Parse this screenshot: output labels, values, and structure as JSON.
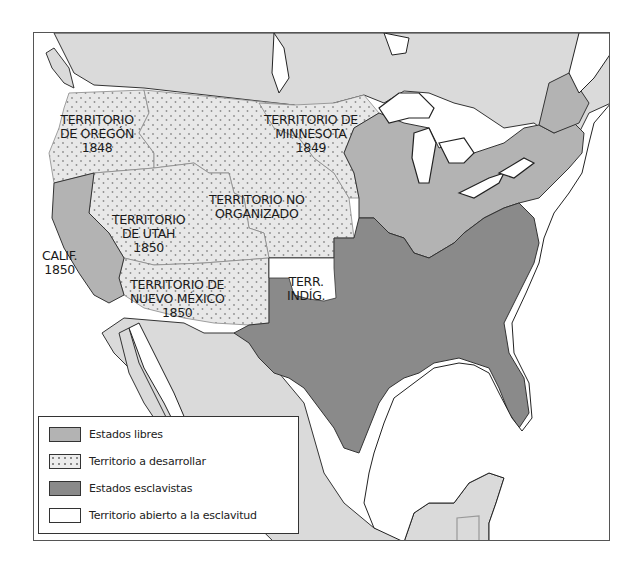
{
  "map": {
    "colors": {
      "foreign_land": "#dadada",
      "free_states": "#b3b3b3",
      "slave_states": "#8a8a8a",
      "territory_dotted": "#e8e8e8",
      "dot": "#9a9a9a",
      "open_to_slavery": "#ffffff",
      "water": "#ffffff",
      "border": "#333333"
    },
    "labels": {
      "oregon": {
        "line1": "TERRITORIO",
        "line2": "DE OREGÓN",
        "year": "1848"
      },
      "minnesota": {
        "line1": "TERRITORIO DE",
        "line2": "MINNESOTA",
        "year": "1849"
      },
      "unorganized": {
        "line1": "TERRITORIO NO",
        "line2": "ORGANIZADO"
      },
      "utah": {
        "line1": "TERRITORIO",
        "line2": "DE UTAH",
        "year": "1850"
      },
      "california": {
        "line1": "CALIF.",
        "year": "1850"
      },
      "new_mexico": {
        "line1": "TERRITORIO DE",
        "line2": "NUEVO MÉXICO",
        "year": "1850"
      },
      "indian_territory": {
        "line1": "TERR.",
        "line2": "INDÍG."
      }
    },
    "legend": {
      "items": [
        {
          "label": "Estados libres",
          "swatch": "free"
        },
        {
          "label": "Territorio a desarrollar",
          "swatch": "dotted"
        },
        {
          "label": "Estados esclavistas",
          "swatch": "slave"
        },
        {
          "label": "Territorio abierto a la esclavitud",
          "swatch": "open"
        }
      ]
    }
  }
}
